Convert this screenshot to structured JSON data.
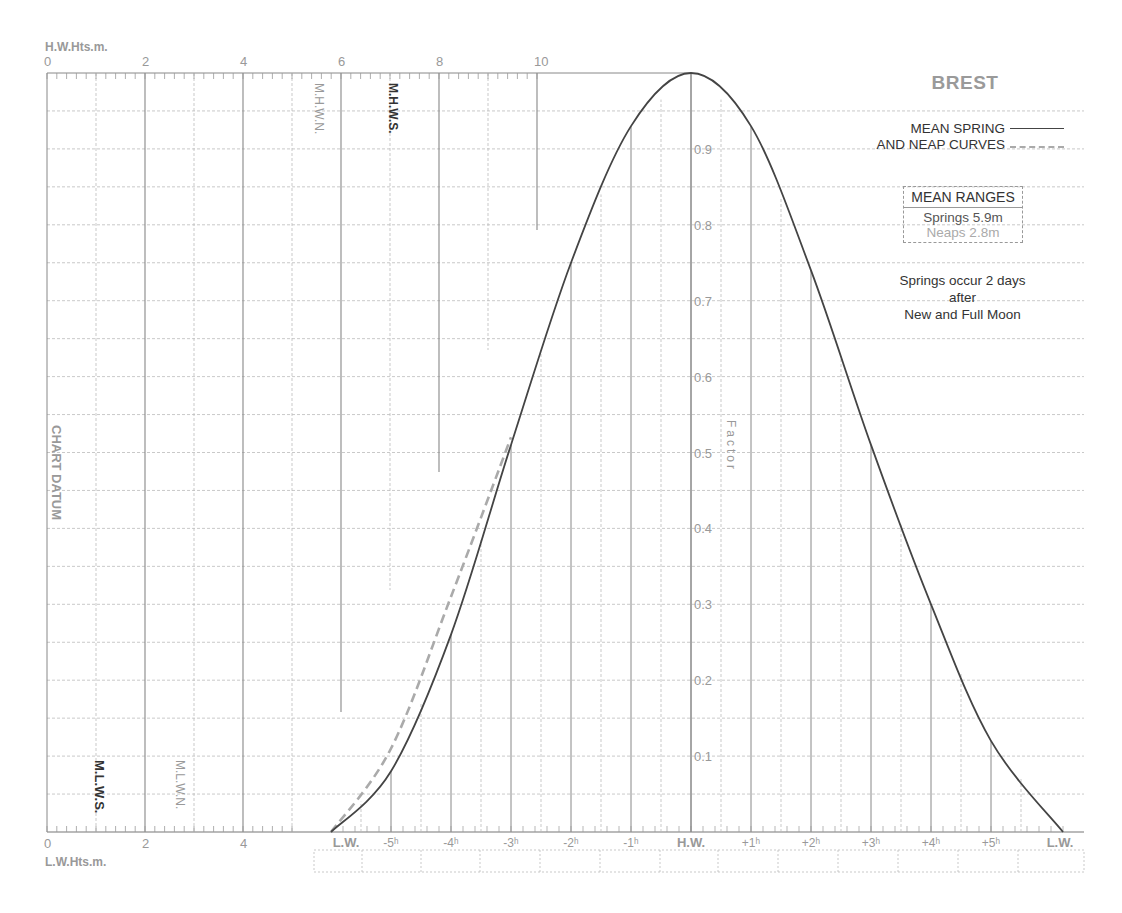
{
  "title": "BREST",
  "legend": {
    "line1": "MEAN SPRING",
    "line2": "AND NEAP CURVES",
    "spring_style": "solid",
    "neap_style": "dashed"
  },
  "mean_ranges": {
    "header": "MEAN RANGES",
    "springs": "Springs  5.9m",
    "neaps": "Neaps  2.8m"
  },
  "note": {
    "line1": "Springs occur 2 days",
    "line2": "after",
    "line3": "New and Full Moon"
  },
  "axes": {
    "top_axis_title": "H.W.Hts.m.",
    "bottom_axis_title": "L.W.Hts.m.",
    "top_ticks": [
      "0",
      "2",
      "4",
      "6",
      "8",
      "10"
    ],
    "bottom_ticks": [
      "0",
      "2",
      "4"
    ],
    "left_label": "CHART DATUM",
    "factor_label": "Factor",
    "factor_ticks": [
      "0.1",
      "0.2",
      "0.3",
      "0.4",
      "0.5",
      "0.6",
      "0.7",
      "0.8",
      "0.9"
    ],
    "time_ticks": [
      "L.W.",
      "-5h",
      "-4h",
      "-3h",
      "-2h",
      "-1h",
      "H.W.",
      "+1h",
      "+2h",
      "+3h",
      "+4h",
      "+5h",
      "L.W."
    ]
  },
  "markers": {
    "mhwn": "M.H.W.N.",
    "mhws": "M.H.W.S.",
    "mlws": "M.L.W.S.",
    "mlwn": "M.L.W.N."
  },
  "colors": {
    "spring_curve": "#444444",
    "neap_curve": "#aaaaaa",
    "grid_major": "#888888",
    "grid_minor": "#bbbbbb",
    "label_grey": "#999999"
  },
  "chart_data": {
    "type": "line",
    "title": "BREST",
    "xlabel": "Hours relative to H.W.",
    "ylabel": "Factor",
    "x": [
      -6,
      -5,
      -4,
      -3,
      -2,
      -1,
      0,
      1,
      2,
      3,
      4,
      5,
      6.2
    ],
    "x_tick_labels": [
      "L.W.",
      "-5h",
      "-4h",
      "-3h",
      "-2h",
      "-1h",
      "H.W.",
      "+1h",
      "+2h",
      "+3h",
      "+4h",
      "+5h",
      "L.W."
    ],
    "series": [
      {
        "name": "Mean Spring Curve",
        "style": "solid",
        "x": [
          -6,
          -5,
          -4,
          -3,
          -2,
          -1,
          0,
          1,
          2,
          3,
          4,
          5,
          6.2
        ],
        "values": [
          0.0,
          0.08,
          0.26,
          0.51,
          0.75,
          0.93,
          1.0,
          0.93,
          0.74,
          0.51,
          0.3,
          0.12,
          0.0
        ]
      },
      {
        "name": "Mean Neap Curve",
        "style": "dashed",
        "x": [
          -6,
          -5,
          -4,
          -3
        ],
        "values": [
          0.0,
          0.11,
          0.31,
          0.52
        ]
      }
    ],
    "ylim": [
      0,
      1.0
    ],
    "y_ticks": [
      0.1,
      0.2,
      0.3,
      0.4,
      0.5,
      0.6,
      0.7,
      0.8,
      0.9
    ],
    "height_axes": {
      "hw_heights_m": {
        "label": "H.W.Hts.m.",
        "ticks": [
          0,
          2,
          4,
          6,
          8,
          10
        ]
      },
      "lw_heights_m": {
        "label": "L.W.Hts.m.",
        "ticks": [
          0,
          2,
          4
        ]
      }
    },
    "reference_levels_m": {
      "MHWN": 5.5,
      "MHWS": 7.0,
      "MLWS": 1.1,
      "MLWN": 2.7
    },
    "mean_ranges_m": {
      "springs": 5.9,
      "neaps": 2.8
    },
    "grid": true,
    "legend_position": "top-right"
  }
}
